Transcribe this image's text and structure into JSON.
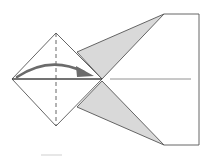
{
  "diagram": {
    "type": "origami-fold-step",
    "colors": {
      "outline": "#555555",
      "fill_shaded": "#d9d9d9",
      "arrow": "#6b6b6b",
      "background": "#ffffff"
    },
    "elements": {
      "diamond": {
        "left": [
          12,
          79
        ],
        "top": [
          56,
          33
        ],
        "right": [
          102,
          79
        ],
        "bottom": [
          56,
          126
        ]
      },
      "valley_fold_line": {
        "x": 56,
        "y1": 33,
        "y2": 126,
        "style": "dashed"
      },
      "center_crease": {
        "x1": 110,
        "x2": 191,
        "y": 79
      },
      "upper_flap": [
        [
          77,
          52
        ],
        [
          164,
          14
        ],
        [
          102,
          79
        ]
      ],
      "lower_flap": [
        [
          77,
          107
        ],
        [
          164,
          145
        ],
        [
          102,
          81
        ]
      ],
      "tail_rect": {
        "x1": 164,
        "x2": 199,
        "y1": 14,
        "y2": 145
      },
      "arrow": {
        "from": [
          17,
          76
        ],
        "to": [
          93,
          75
        ],
        "direction": "right"
      }
    }
  }
}
